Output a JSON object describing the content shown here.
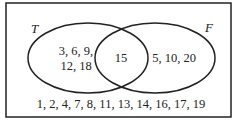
{
  "diagram": {
    "type": "venn",
    "universe_border_color": "#222222",
    "sets": [
      {
        "name": "T",
        "only": [
          "3, 6, 9,",
          "12, 18"
        ]
      },
      {
        "name": "F",
        "only": [
          "5, 10, 20"
        ]
      }
    ],
    "intersection": "15",
    "outside": "1, 2, 4, 7, 8, 11, 13, 14, 16, 17, 19"
  }
}
